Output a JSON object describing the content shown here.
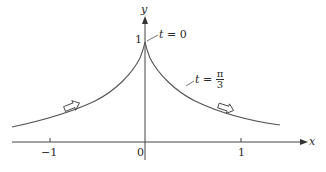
{
  "diagram": {
    "axes": {
      "x_label": "x",
      "y_label": "y",
      "x_ticks": [
        {
          "value": -1,
          "label": "−1"
        },
        {
          "value": 0,
          "label": "0"
        },
        {
          "value": 1,
          "label": "1"
        }
      ],
      "y_ticks": [
        {
          "value": 1,
          "label": "1"
        }
      ]
    },
    "annotations": {
      "cusp_label_var": "t",
      "cusp_label_rest": " = 0",
      "mid_label_var": "t",
      "mid_label_eq": " = ",
      "mid_label_num": "π",
      "mid_label_den": "3"
    },
    "curve": {
      "description": "symmetric curve with cusp at (0,1), decreasing toward x-axis on both sides",
      "direction_arrows": 2,
      "color": "#555555"
    }
  }
}
